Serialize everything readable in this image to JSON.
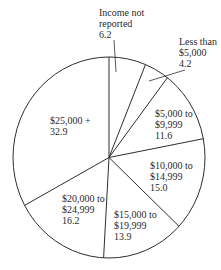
{
  "chart_data": {
    "type": "pie",
    "title": "",
    "start_angle_deg": 0,
    "direction": "clockwise",
    "categories": [
      "Income not reported",
      "Less than $5,000",
      "$5,000 to $9,999",
      "$10,000 to $14,999",
      "$15,000 to $19,999",
      "$20,000 to $24,999",
      "$25,000 +"
    ],
    "values": [
      6.2,
      4.2,
      11.6,
      15.0,
      13.9,
      16.2,
      32.9
    ],
    "unit": "percent"
  },
  "labels": [
    {
      "line1": "Income not",
      "line2": "reported",
      "value": "6.2"
    },
    {
      "line1": "Less than",
      "line2": "$5,000",
      "value": "4.2"
    },
    {
      "line1": "$5,000 to",
      "line2": "$9,999",
      "value": "11.6"
    },
    {
      "line1": "$10,000 to",
      "line2": "$14,999",
      "value": "15.0"
    },
    {
      "line1": "$15,000 to",
      "line2": "$19,999",
      "value": "13.9"
    },
    {
      "line1": "$20,000 to",
      "line2": "$24,999",
      "value": "16.2"
    },
    {
      "line1": "$25,000 +",
      "value": "32.9"
    }
  ],
  "style": {
    "stroke": "#2e2e2e",
    "fill": "#ffffff"
  }
}
